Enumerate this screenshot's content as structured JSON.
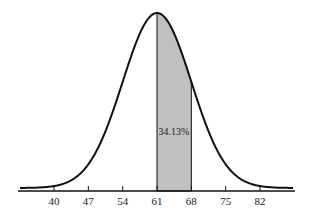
{
  "chart_data": {
    "type": "area",
    "title": "",
    "xlabel": "",
    "ylabel": "",
    "distribution": "normal",
    "mean": 61,
    "std_dev": 7,
    "x_ticks": [
      40,
      47,
      54,
      61,
      68,
      75,
      82
    ],
    "x_tick_labels": [
      "40",
      "47",
      "54",
      "61",
      "68",
      "75",
      "82"
    ],
    "shaded_region": {
      "from": 61,
      "to": 68,
      "label": "34.13%",
      "fill": "#c0c0c0"
    },
    "grid": false,
    "legend": null
  },
  "labels": {
    "area_label": "34.13%",
    "ticks": [
      "40",
      "47",
      "54",
      "61",
      "68",
      "75",
      "82"
    ]
  }
}
